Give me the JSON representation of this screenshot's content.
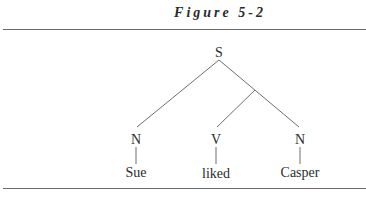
{
  "figure": {
    "title": "Figure 5-2"
  },
  "tree": {
    "root": "S",
    "nodes": [
      {
        "id": "S",
        "label": "S"
      },
      {
        "id": "N1",
        "label": "N",
        "word": "Sue"
      },
      {
        "id": "V",
        "label": "V",
        "word": "liked"
      },
      {
        "id": "N2",
        "label": "N",
        "word": "Casper"
      }
    ],
    "structure": "S branches to N (Sue) and an unlabeled node that branches to V (liked) and N (Casper)"
  }
}
